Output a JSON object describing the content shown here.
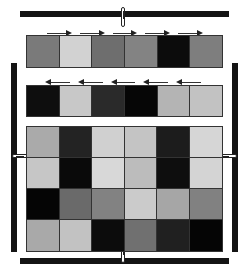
{
  "top_bar": {
    "color": "#141414"
  },
  "bottom_bar": {
    "color": "#141414"
  },
  "left_bar": {
    "color": "#141414"
  },
  "right_bar": {
    "color": "#141414"
  },
  "top_row": {
    "arrow_direction": "right",
    "cells": [
      "#7a7a7a",
      "#d2d2d2",
      "#6e6e6e",
      "#838383",
      "#0c0c0c",
      "#7e7e7e"
    ]
  },
  "middle_row": {
    "arrow_direction": "left",
    "cells": [
      "#0e0e0e",
      "#c8c8c8",
      "#2a2a2a",
      "#060606",
      "#b4b4b4",
      "#c2c2c2"
    ]
  },
  "main_grid": {
    "rows": 4,
    "cols": 6,
    "cells": [
      [
        "#aaaaaa",
        "#232323",
        "#d0d0d0",
        "#c4c4c4",
        "#1c1c1c",
        "#d6d6d6"
      ],
      [
        "#c6c6c6",
        "#0a0a0a",
        "#d8d8d8",
        "#bcbcbc",
        "#0e0e0e",
        "#d4d4d4"
      ],
      [
        "#050505",
        "#6a6a6a",
        "#828282",
        "#cbcbcb",
        "#a6a6a6",
        "#818181"
      ],
      [
        "#a9a9a9",
        "#c2c2c2",
        "#0c0c0c",
        "#707070",
        "#202020",
        "#050505"
      ]
    ]
  }
}
